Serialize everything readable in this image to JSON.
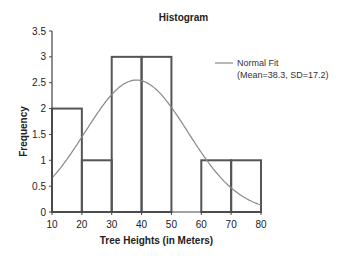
{
  "chart_data": {
    "type": "bar",
    "subtype": "histogram",
    "title": "Histogram",
    "xlabel": "Tree Heights (in Meters)",
    "ylabel": "Frequency",
    "bin_edges": [
      10,
      20,
      30,
      40,
      50,
      60,
      70,
      80
    ],
    "categories": [
      "10-20",
      "20-30",
      "30-40",
      "40-50",
      "50-60",
      "60-70",
      "70-80"
    ],
    "values": [
      2,
      1,
      3,
      3,
      0,
      1,
      1
    ],
    "x_ticks": [
      10,
      20,
      30,
      40,
      50,
      60,
      70,
      80
    ],
    "y_ticks": [
      0,
      0.5,
      1,
      1.5,
      2,
      2.5,
      3,
      3.5
    ],
    "xlim": [
      10,
      80
    ],
    "ylim": [
      0,
      3.5
    ],
    "grid": false,
    "series": [
      {
        "name": "Frequency",
        "type": "bar",
        "values": [
          2,
          1,
          3,
          3,
          0,
          1,
          1
        ]
      },
      {
        "name": "Normal Fit (Mean=38.3, SD=17.2)",
        "type": "line",
        "mean": 38.3,
        "sd": 17.2
      }
    ],
    "legend": {
      "position": "right",
      "line1": "Normal Fit",
      "line2": "(Mean=38.3, SD=17.2)"
    }
  }
}
